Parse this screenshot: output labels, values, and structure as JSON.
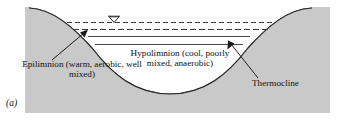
{
  "figure": {
    "panel_label": "(a)",
    "kind": "lake-thermal-stratification-cross-section",
    "colors": {
      "background": "#ffffff",
      "land_fill": "#c9c9c9",
      "water_fill": "#ffffff",
      "line": "#1a1a1a",
      "text": "#111111"
    }
  },
  "labels": {
    "epilimnion": "Epilimnion (warm, aerobic, well mixed)",
    "hypolimnion": "Hypolimnion (cool, poorly mixed, anaerobic)",
    "thermocline": "Thermocline"
  },
  "features": {
    "water_surface_marker": "water-level-triangle",
    "surface_dashed_lines": 2,
    "thermocline_solid_lines": 2,
    "leader_arrows": 2
  }
}
